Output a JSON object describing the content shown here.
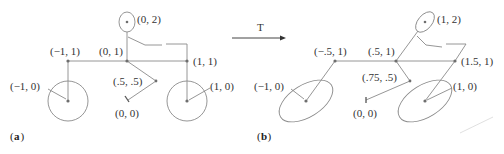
{
  "figure": {
    "transform_label": "T",
    "panel_a": {
      "caption_letter": "a",
      "labels": {
        "head": "(0, 2)",
        "left_top": "(−1, 1)",
        "center_top": "(0, 1)",
        "right_top": "(1, 1)",
        "pedal": "(.5, .5)",
        "left_wheel": "(−1, 0)",
        "right_wheel": "(1, 0)",
        "origin": "(0, 0)"
      }
    },
    "panel_b": {
      "caption_letter": "b",
      "labels": {
        "head": "(1, 2)",
        "left_top": "(−.5, 1)",
        "center_top": "(.5, 1)",
        "right_top": "(1.5, 1)",
        "pedal": "(.75, .5)",
        "left_wheel": "(−1, 0)",
        "right_wheel": "(1, 0)",
        "origin": "(0, 0)"
      }
    },
    "colors": {
      "line": "#8a8a8a",
      "point": "#6e6e6e",
      "text": "#333333"
    }
  }
}
